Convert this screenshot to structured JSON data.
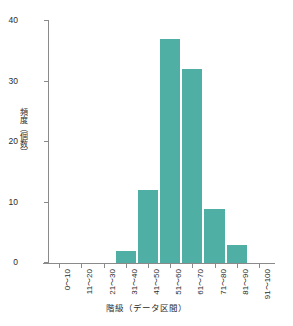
{
  "chart_data": {
    "type": "bar",
    "title": "",
    "subtitle": "",
    "xlabel": "階級（データ区間）",
    "ylabel": "頻度（個数）",
    "categories": [
      "0～10",
      "11～20",
      "21～30",
      "31～40",
      "41～50",
      "51～60",
      "61～70",
      "71～80",
      "81～90",
      "91～100"
    ],
    "values": [
      0,
      0,
      0,
      2,
      12,
      37,
      32,
      9,
      3,
      0
    ],
    "ylim": [
      0,
      40
    ],
    "yticks": [
      0,
      10,
      20,
      30,
      40
    ],
    "ytick_labels": [
      "0",
      "10",
      "20",
      "30",
      "40"
    ],
    "grid": false,
    "legend": false,
    "legend_position": "none",
    "bar_color": "#4FAFA5",
    "axis_color": "#8a8a8a",
    "text_color": "#2b2b2b",
    "background_color": "#ffffff",
    "xtick_label_rotation": "vertical",
    "bars_touching": true
  }
}
